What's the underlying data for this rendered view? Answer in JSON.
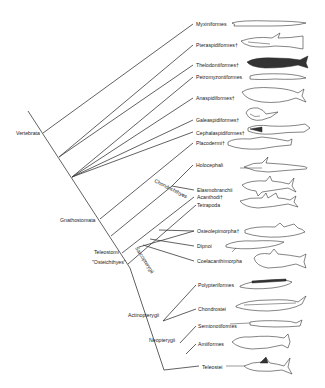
{
  "diagram": {
    "type": "phylogenetic-tree",
    "root_label": "Vertebrata",
    "taxa": [
      {
        "id": "myxiniformes",
        "label": "Myxiniformes",
        "x": 196,
        "y": 24
      },
      {
        "id": "pteraspidiformes",
        "label": "Pteraspidiformes†",
        "x": 196,
        "y": 45
      },
      {
        "id": "thelodontiformes",
        "label": "Thelodontiformes†",
        "x": 196,
        "y": 65
      },
      {
        "id": "petromyzontiformes",
        "label": "Petromyzontiformes",
        "x": 196,
        "y": 77
      },
      {
        "id": "anaspidiformes",
        "label": "Anaspidiformes†",
        "x": 196,
        "y": 98
      },
      {
        "id": "galeaspidiformes",
        "label": "Galeaspidiformes†",
        "x": 196,
        "y": 120
      },
      {
        "id": "cephalaspidiformes",
        "label": "Cephalaspidiformes†",
        "x": 196,
        "y": 134
      },
      {
        "id": "placodermi",
        "label": "Placodermi†",
        "x": 196,
        "y": 143
      },
      {
        "id": "holocephali",
        "label": "Holocephali",
        "x": 196,
        "y": 166
      },
      {
        "id": "elasmobranchii",
        "label": "Elasmobranchii",
        "x": 197,
        "y": 190
      },
      {
        "id": "acanthodi",
        "label": "Acanthodi†",
        "x": 197,
        "y": 197
      },
      {
        "id": "tetrapoda",
        "label": "Tetrapoda",
        "x": 197,
        "y": 205
      },
      {
        "id": "osteolepimorpha",
        "label": "Osteolepimorpha†",
        "x": 197,
        "y": 231
      },
      {
        "id": "dipnoi",
        "label": "Dipnoi",
        "x": 197,
        "y": 246
      },
      {
        "id": "coelacanthimorpha",
        "label": "Coelacanthimorpha",
        "x": 197,
        "y": 261
      },
      {
        "id": "polypteriformes",
        "label": "Polypteriformes",
        "x": 198,
        "y": 285
      },
      {
        "id": "chondrostei",
        "label": "Chondrostei",
        "x": 198,
        "y": 309
      },
      {
        "id": "semionotiformes",
        "label": "Semionotiformes",
        "x": 198,
        "y": 326
      },
      {
        "id": "amiiformes",
        "label": "Amiiformes",
        "x": 198,
        "y": 344
      },
      {
        "id": "teleostei",
        "label": "Teleostei",
        "x": 202,
        "y": 367
      }
    ],
    "clades": [
      {
        "id": "vertebrata",
        "label": "Vertebrata",
        "x": 16,
        "y": 134
      },
      {
        "id": "gnathostomata",
        "label": "Gnathostomata",
        "x": 60,
        "y": 221
      },
      {
        "id": "teleostomi",
        "label": "Teleostomi",
        "x": 94,
        "y": 253
      },
      {
        "id": "osteichthyes",
        "label": "\"Osteichthyes\"",
        "x": 92,
        "y": 263
      },
      {
        "id": "chondrichthyes",
        "label": "Chondrichthyes",
        "x": 155,
        "y": 182,
        "rotate": 25
      },
      {
        "id": "sarcopterygii",
        "label": "Sarcopterygii",
        "x": 136,
        "y": 250,
        "rotate": 58
      },
      {
        "id": "actinopterygii",
        "label": "Actinopterygii",
        "x": 128,
        "y": 316
      },
      {
        "id": "neopterygii",
        "label": "Neopterygii",
        "x": 150,
        "y": 341
      }
    ],
    "extinct_marker": "†"
  }
}
